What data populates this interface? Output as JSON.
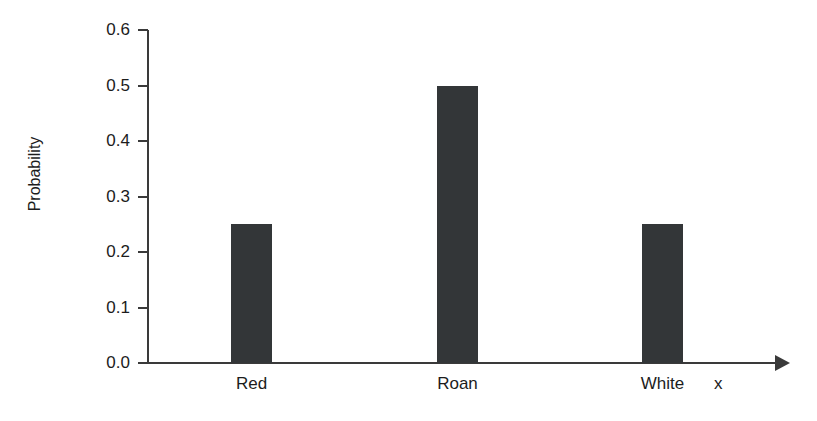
{
  "chart_data": {
    "type": "bar",
    "title": "",
    "subtitle": "",
    "categories": [
      "Red",
      "Roan",
      "White"
    ],
    "values": [
      0.25,
      0.5,
      0.25
    ],
    "xlabel": "x",
    "ylabel": "Probability",
    "ylim": [
      0.0,
      0.6
    ],
    "ytick_labels": [
      "0.0",
      "0.1",
      "0.2",
      "0.3",
      "0.4",
      "0.5",
      "0.6"
    ],
    "ytick_values": [
      0.0,
      0.1,
      0.2,
      0.3,
      0.4,
      0.5,
      0.6
    ],
    "grid": false,
    "legend": null,
    "annotations": [],
    "bar_color": "#333638",
    "axis_color": "#3a3a3a",
    "background_color": "#ffffff",
    "x_axis_has_arrow": true
  },
  "axis": {
    "y_title": "Probability",
    "x_title": "x"
  },
  "ticks": {
    "y": [
      {
        "label": "0.6",
        "value": 0.6
      },
      {
        "label": "0.5",
        "value": 0.5
      },
      {
        "label": "0.4",
        "value": 0.4
      },
      {
        "label": "0.3",
        "value": 0.3
      },
      {
        "label": "0.2",
        "value": 0.2
      },
      {
        "label": "0.1",
        "value": 0.1
      },
      {
        "label": "0.0",
        "value": 0.0
      }
    ]
  },
  "bars": [
    {
      "label": "Red",
      "value": 0.25
    },
    {
      "label": "Roan",
      "value": 0.5
    },
    {
      "label": "White",
      "value": 0.25
    }
  ]
}
